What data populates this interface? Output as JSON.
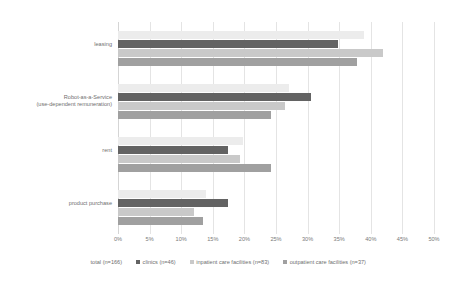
{
  "chart_data": {
    "type": "bar",
    "orientation": "horizontal",
    "title": "",
    "xlabel": "",
    "ylabel": "",
    "xlim": [
      0,
      50
    ],
    "xunit": "%",
    "grid": true,
    "legend_position": "bottom",
    "categories": [
      "leasing",
      "Robot-as-a-Service\n(use-dependent remuneration)",
      "rent",
      "product purchase"
    ],
    "xticks": [
      "0%",
      "5%",
      "10%",
      "15%",
      "20%",
      "25%",
      "30%",
      "35%",
      "40%",
      "45%",
      "50%"
    ],
    "xtick_values": [
      0,
      5,
      10,
      15,
      20,
      25,
      30,
      35,
      40,
      45,
      50
    ],
    "series": [
      {
        "name": "total (n=166)",
        "key": "total",
        "color": "#ececec",
        "values": [
          39.0,
          27.0,
          19.8,
          14.0
        ]
      },
      {
        "name": "clinics (n=46)",
        "key": "clinics",
        "color": "#636363",
        "values": [
          34.8,
          30.5,
          17.4,
          17.4
        ]
      },
      {
        "name": "inpatient care facilities (n=83)",
        "key": "inpatient",
        "color": "#c9c9c9",
        "values": [
          42.0,
          26.5,
          19.3,
          12.0
        ]
      },
      {
        "name": "outpatient care facilities (n=37)",
        "key": "outpatient",
        "color": "#a0a0a0",
        "values": [
          37.8,
          24.2,
          24.2,
          13.5
        ]
      }
    ]
  },
  "legend": {
    "items": [
      {
        "label": "total (n=166)",
        "swatch": false
      },
      {
        "label": "clinics (n=46)",
        "swatch": true
      },
      {
        "label": "inpatient care facilities (n=83)",
        "swatch": true
      },
      {
        "label": "outpatient care facilities (n=37)",
        "swatch": true
      }
    ]
  }
}
